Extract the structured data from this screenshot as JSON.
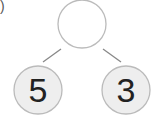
{
  "label_paren": ")",
  "diagram": {
    "type": "number-bond",
    "whole": "",
    "parts": [
      "5",
      "3"
    ],
    "colors": {
      "whole_fill": "#ffffff",
      "part_fill": "#eeeeee",
      "stroke": "#bbbbbb",
      "line": "#888888"
    }
  }
}
